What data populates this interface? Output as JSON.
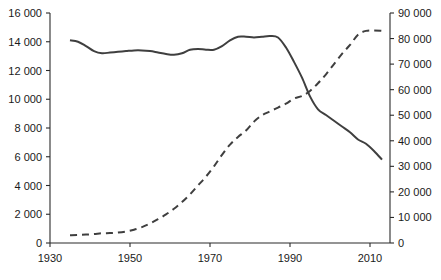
{
  "chart_data": {
    "type": "line",
    "title": "",
    "subtitle": "",
    "xlabel": "",
    "ylabel": "",
    "y2label": "",
    "grid": false,
    "legend": "none",
    "xlim": [
      1930,
      2015
    ],
    "ylim": [
      0,
      16000
    ],
    "y2lim": [
      0,
      90000
    ],
    "xticks": [
      1930,
      1950,
      1970,
      1990,
      2010
    ],
    "xticklabels": [
      "1930",
      "1950",
      "1970",
      "1990",
      "2010"
    ],
    "yticks": [
      0,
      2000,
      4000,
      6000,
      8000,
      10000,
      12000,
      14000,
      16000
    ],
    "yticklabels": [
      "0",
      "2 000",
      "4 000",
      "6 000",
      "8 000",
      "10 000",
      "12 000",
      "14 000",
      "16 000"
    ],
    "y2ticks": [
      0,
      10000,
      20000,
      30000,
      40000,
      50000,
      60000,
      70000,
      80000,
      90000
    ],
    "y2ticklabels": [
      "0",
      "10 000",
      "20 000",
      "30 000",
      "40 000",
      "50 000",
      "60 000",
      "70 000",
      "80 000",
      "90 000"
    ],
    "series": [
      {
        "name": "solid-series",
        "style": "solid",
        "axis": "left",
        "color": "#3f3f3f",
        "x": [
          1935,
          1937,
          1939,
          1941,
          1943,
          1945,
          1947,
          1949,
          1951,
          1953,
          1955,
          1957,
          1959,
          1961,
          1963,
          1965,
          1967,
          1969,
          1971,
          1973,
          1975,
          1977,
          1979,
          1981,
          1983,
          1985,
          1987,
          1989,
          1991,
          1993,
          1995,
          1997,
          1999,
          2001,
          2003,
          2005,
          2007,
          2009,
          2011,
          2013
        ],
        "values": [
          14100,
          14000,
          13700,
          13350,
          13200,
          13250,
          13300,
          13350,
          13400,
          13400,
          13350,
          13250,
          13150,
          13100,
          13200,
          13450,
          13500,
          13450,
          13450,
          13700,
          14100,
          14350,
          14350,
          14300,
          14350,
          14400,
          14300,
          13600,
          12600,
          11500,
          10200,
          9300,
          8900,
          8500,
          8100,
          7700,
          7200,
          6900,
          6400,
          5800
        ]
      },
      {
        "name": "dashed-series",
        "style": "dashed",
        "axis": "right",
        "color": "#3f3f3f",
        "x": [
          1935,
          1937,
          1939,
          1941,
          1943,
          1945,
          1947,
          1949,
          1951,
          1953,
          1955,
          1957,
          1959,
          1961,
          1963,
          1965,
          1967,
          1969,
          1971,
          1973,
          1975,
          1977,
          1979,
          1981,
          1983,
          1985,
          1987,
          1989,
          1991,
          1993,
          1995,
          1997,
          1999,
          2001,
          2003,
          2005,
          2007,
          2009,
          2011,
          2013
        ],
        "values": [
          3000,
          3100,
          3300,
          3500,
          3800,
          3900,
          4100,
          4500,
          5200,
          6200,
          7600,
          9300,
          11200,
          13400,
          16000,
          19000,
          22500,
          26000,
          30000,
          34500,
          38500,
          41500,
          44000,
          47500,
          50000,
          51500,
          53000,
          54500,
          56500,
          57500,
          59500,
          62500,
          66000,
          70000,
          74000,
          77500,
          81500,
          83000,
          83200,
          83000
        ]
      }
    ]
  },
  "axes": {
    "left_axis_name": "left-value-axis",
    "right_axis_name": "right-value-axis",
    "bottom_axis_name": "year-axis"
  }
}
